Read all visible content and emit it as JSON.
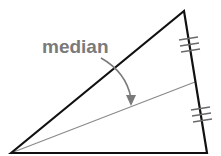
{
  "diagram": {
    "label": "median",
    "colors": {
      "triangle": "#111111",
      "median_line": "#8a8a8a",
      "label": "#7a7a7a",
      "arrow": "#7a7a7a",
      "ticks": "#6a6a6a"
    },
    "vertices": {
      "A": [
        11,
        153
      ],
      "B": [
        184,
        11
      ],
      "C": [
        207,
        153
      ]
    },
    "median": {
      "from": "A",
      "to_midpoint_of": [
        "B",
        "C"
      ],
      "midpoint": [
        195,
        82
      ]
    },
    "congruence_marks": {
      "count_per_segment": 3,
      "segments": [
        "B-M",
        "M-C"
      ]
    }
  }
}
